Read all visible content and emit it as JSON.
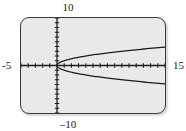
{
  "figure": {
    "kind": "graphing-calculator-screen",
    "background_color": "#ffffff",
    "screen_fill_color": "#e9e9e9",
    "frame_border_color": "#3a3a3a",
    "curve_color": "#1c1c1c",
    "axis_color": "#1c1c1c"
  },
  "labels": {
    "y_max": "10",
    "y_min": "–10",
    "x_min": "-5",
    "x_max": "15"
  },
  "chart_data": {
    "type": "line",
    "title": "",
    "subtitle": "",
    "xlabel": "",
    "ylabel": "",
    "grid": false,
    "legend": "none",
    "window": {
      "xmin": -5,
      "xmax": 15,
      "ymin": -10,
      "ymax": 10,
      "xscl": 1,
      "yscl": 1
    },
    "axis_ticks": {
      "x_tick_spacing": 1,
      "y_tick_spacing": 1,
      "x_tick_count": 20,
      "y_tick_count": 20
    },
    "relation": "x = y^2",
    "series": [
      {
        "name": "upper branch  y = √x",
        "x": [
          0,
          0.25,
          0.5,
          1,
          1.5,
          2,
          3,
          4,
          5,
          6,
          7,
          8,
          9,
          10,
          11,
          12,
          13,
          14,
          15
        ],
        "y": [
          0,
          0.5,
          0.71,
          1,
          1.22,
          1.41,
          1.73,
          2,
          2.24,
          2.45,
          2.65,
          2.83,
          3,
          3.16,
          3.32,
          3.46,
          3.61,
          3.74,
          3.87
        ]
      },
      {
        "name": "lower branch  y = -√x",
        "x": [
          0,
          0.25,
          0.5,
          1,
          1.5,
          2,
          3,
          4,
          5,
          6,
          7,
          8,
          9,
          10,
          11,
          12,
          13,
          14,
          15
        ],
        "y": [
          0,
          -0.5,
          -0.71,
          -1,
          -1.22,
          -1.41,
          -1.73,
          -2,
          -2.24,
          -2.45,
          -2.65,
          -2.83,
          -3,
          -3.16,
          -3.32,
          -3.46,
          -3.61,
          -3.74,
          -3.87
        ]
      }
    ]
  }
}
